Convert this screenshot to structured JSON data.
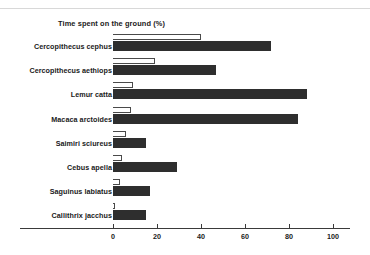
{
  "figure": {
    "title": "Time spent on the ground (%)",
    "bar_color": "#2e2e2e",
    "open_bar_color": "#ffffff",
    "open_bar_border": "#4a4a4a",
    "axis_color": "#3a3a3a",
    "background": "#ffffff"
  },
  "chart_data": {
    "type": "bar",
    "orientation": "horizontal",
    "title": "Time spent on the ground (%)",
    "xlabel": "",
    "ylabel": "",
    "xlim": [
      0,
      100
    ],
    "xticks": [
      0,
      20,
      40,
      60,
      80,
      100
    ],
    "xtick_labels": [
      "0",
      "20",
      "40",
      "60",
      "80",
      "100"
    ],
    "grid": false,
    "legend": false,
    "categories": [
      "Cercopithecus cephus",
      "Cercopithecus aethiops",
      "Lemur catta",
      "Macaca arctoides",
      "Saimiri sciureus",
      "Cebus apella",
      "Saguinus labiatus",
      "Callithrix jacchus"
    ],
    "series": [
      {
        "name": "open",
        "style": "outlined",
        "values": [
          40,
          19,
          9,
          8,
          6,
          4,
          3,
          1
        ]
      },
      {
        "name": "filled",
        "style": "solid",
        "values": [
          72,
          47,
          88,
          84,
          15,
          29,
          17,
          15
        ]
      }
    ]
  }
}
